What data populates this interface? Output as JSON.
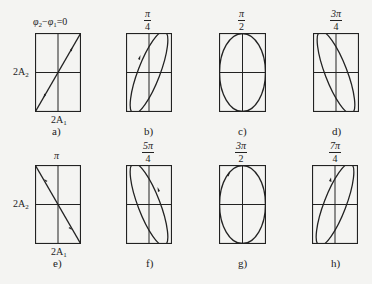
{
  "figure": {
    "stroke_color": "#222222",
    "background_color": "#f4f4f2",
    "panels": [
      {
        "id": "a",
        "caption": "a)",
        "phase_title": "φ2−φ1=0",
        "phase_num": "",
        "phase_den": "",
        "shape": "line-positive"
      },
      {
        "id": "b",
        "caption": "b)",
        "phase_title": "",
        "phase_num": "π",
        "phase_den": "4",
        "shape": "ellipse-tilted-right"
      },
      {
        "id": "c",
        "caption": "c)",
        "phase_title": "",
        "phase_num": "π",
        "phase_den": "2",
        "shape": "ellipse-upright"
      },
      {
        "id": "d",
        "caption": "d)",
        "phase_title": "",
        "phase_num": "3π",
        "phase_den": "4",
        "shape": "ellipse-tilted-left"
      },
      {
        "id": "e",
        "caption": "e)",
        "phase_title": "π",
        "phase_num": "",
        "phase_den": "",
        "shape": "line-negative"
      },
      {
        "id": "f",
        "caption": "f)",
        "phase_title": "",
        "phase_num": "5π",
        "phase_den": "4",
        "shape": "ellipse-tilted-left"
      },
      {
        "id": "g",
        "caption": "g)",
        "phase_title": "",
        "phase_num": "3π",
        "phase_den": "2",
        "shape": "ellipse-upright"
      },
      {
        "id": "h",
        "caption": "h)",
        "phase_title": "",
        "phase_num": "7π",
        "phase_den": "4",
        "shape": "ellipse-tilted-right"
      }
    ],
    "axis_labels": {
      "y_base": "2A",
      "y_sub": "2",
      "x_base": "2A",
      "x_sub": "1"
    },
    "title_a": {
      "phi2": "φ",
      "sub2": "2",
      "minus": "−",
      "phi1": "φ",
      "sub1": "1",
      "eq": "=0"
    }
  }
}
